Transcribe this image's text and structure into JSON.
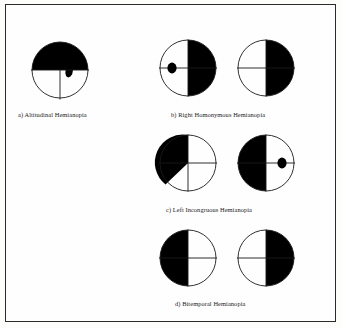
{
  "figure": {
    "border_color": "#2b2b2b",
    "fill_color": "#000000",
    "background_color": "#fefefe",
    "panels": [
      {
        "key": "a",
        "caption": "a) Altitudinal Hemianopia",
        "fields": [
          {
            "eye": "single",
            "defect": "superior-altitudinal-with-inferior-nasal-notch",
            "filled_regions": [
              "upper-left-quadrant",
              "upper-right-quadrant",
              "notch-into-lower-right-quadrant"
            ],
            "has_dot": false
          }
        ]
      },
      {
        "key": "b",
        "caption": "b) Right Homonymous Hemianopia",
        "fields": [
          {
            "eye": "left",
            "defect": "right-half",
            "filled_regions": [
              "upper-right-quadrant",
              "lower-right-quadrant"
            ],
            "has_dot": true,
            "dot_side": "left"
          },
          {
            "eye": "right",
            "defect": "right-half",
            "filled_regions": [
              "upper-right-quadrant",
              "lower-right-quadrant"
            ],
            "has_dot": false
          }
        ]
      },
      {
        "key": "c",
        "caption": "c) Left Incongruous Hemianopia",
        "fields": [
          {
            "eye": "left",
            "defect": "left-upper-quadrant-plus-wedge",
            "filled_regions": [
              "upper-left-quadrant",
              "wedge-into-lower-left-quadrant"
            ],
            "has_dot": false
          },
          {
            "eye": "right",
            "defect": "left-half",
            "filled_regions": [
              "upper-left-quadrant",
              "lower-left-quadrant"
            ],
            "has_dot": true,
            "dot_side": "right"
          }
        ]
      },
      {
        "key": "d",
        "caption": "d) Bitemporal Hemianopia",
        "fields": [
          {
            "eye": "left",
            "defect": "left-half",
            "filled_regions": [
              "upper-left-quadrant",
              "lower-left-quadrant"
            ],
            "has_dot": false
          },
          {
            "eye": "right",
            "defect": "right-half",
            "filled_regions": [
              "upper-right-quadrant",
              "lower-right-quadrant"
            ],
            "has_dot": false
          }
        ]
      }
    ]
  }
}
